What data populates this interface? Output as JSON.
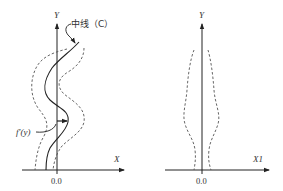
{
  "figure": {
    "left_panel": {
      "y_axis_label": "Y",
      "x_axis_label": "X",
      "origin_label": "0.0",
      "centerline_label": "中线（C）",
      "function_label": "f′(y)"
    },
    "right_panel": {
      "y_axis_label": "Y",
      "x_axis_label": "X1",
      "origin_label": "0.0"
    },
    "colors": {
      "line": "#222222",
      "dashed": "#555555"
    }
  }
}
